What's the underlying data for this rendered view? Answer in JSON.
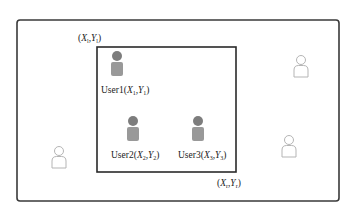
{
  "diagram": {
    "type": "region-query",
    "outer_region": {
      "label": "area"
    },
    "query_rectangle": {
      "top_left_label": {
        "X": "X",
        "Y": "Y",
        "sub": "l"
      },
      "bottom_right_label": {
        "X": "X",
        "Y": "Y",
        "sub": "r"
      }
    },
    "users_inside": [
      {
        "name": "User1",
        "X": "X",
        "Y": "Y",
        "sub": "1"
      },
      {
        "name": "User2",
        "X": "X",
        "Y": "Y",
        "sub": "2"
      },
      {
        "name": "User3",
        "X": "X",
        "Y": "Y",
        "sub": "3"
      }
    ],
    "users_outside_count": 3,
    "colors": {
      "inside_user_fill": "#8c8c8c",
      "outside_user_stroke": "#b5b5b5",
      "border": "#333333"
    }
  }
}
